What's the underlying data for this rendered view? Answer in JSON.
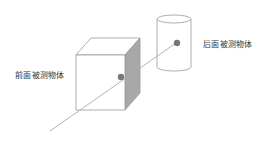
{
  "diagram": {
    "labels": {
      "front_object": "前面被测物体",
      "back_object": "后面被测物体"
    },
    "colors": {
      "outline": "#999999",
      "side_face": "#a8a8a8",
      "ray": "#aaaaaa",
      "hit_point": "#777777",
      "text": "#333333"
    }
  }
}
